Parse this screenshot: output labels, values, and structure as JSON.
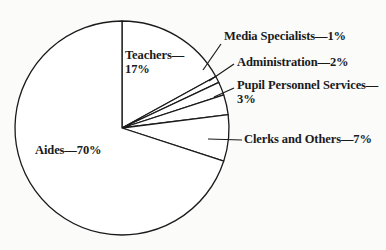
{
  "chart_data": {
    "type": "pie",
    "title": "",
    "start_angle_deg": 0,
    "direction": "clockwise",
    "slices": [
      {
        "label": "Teachers",
        "value": 17,
        "text_line1": "Teachers—",
        "text_line2": "17%"
      },
      {
        "label": "Media Specialists",
        "value": 1,
        "text_line1": "Media Specialists—1%"
      },
      {
        "label": "Administration",
        "value": 2,
        "text_line1": "Administration—2%"
      },
      {
        "label": "Pupil Personnel Services",
        "value": 3,
        "text_line1": "Pupil Personnel Services—",
        "text_line2": "3%"
      },
      {
        "label": "Clerks and Others",
        "value": 7,
        "text_line1": "Clerks and Others—7%"
      },
      {
        "label": "Aides",
        "value": 70,
        "text_line1": "Aides—70%"
      }
    ],
    "categories": [
      "Teachers",
      "Media Specialists",
      "Administration",
      "Pupil Personnel Services",
      "Clerks and Others",
      "Aides"
    ],
    "values": [
      17,
      1,
      2,
      3,
      7,
      70
    ],
    "unit": "%",
    "legend": "none (labels placed inside/beside slices)",
    "colors": {
      "fill": "#ffffff",
      "stroke": "#1a1a1a"
    }
  }
}
